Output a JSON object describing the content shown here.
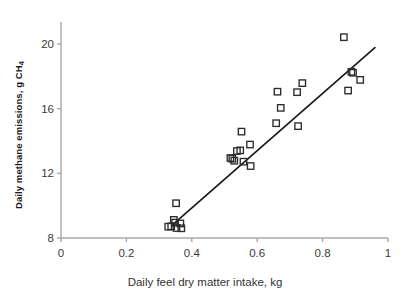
{
  "chart_data": {
    "type": "scatter",
    "title": "",
    "xlabel": "Daily feel dry matter intake, kg",
    "ylabel_prefix": "Daily methane emissions, g CH",
    "ylabel_subscript": "4",
    "xlim": [
      0,
      1
    ],
    "ylim": [
      8,
      21.2
    ],
    "xticks": [
      0,
      0.2,
      0.4,
      0.6,
      0.8,
      1
    ],
    "xtick_labels": [
      "0",
      "0.2",
      "0.4",
      "0.6",
      "0.8",
      "1"
    ],
    "yticks": [
      8,
      12,
      16,
      20
    ],
    "ytick_labels": [
      "8",
      "12",
      "16",
      "20"
    ],
    "grid": false,
    "legend": null,
    "marker": "open-square",
    "marker_color": "#2b2b2b",
    "axis_color": "#a8a8a8",
    "trendline_color": "#1a1a1a",
    "points": [
      {
        "x": 0.328,
        "y": 8.7
      },
      {
        "x": 0.337,
        "y": 8.72
      },
      {
        "x": 0.345,
        "y": 9.12
      },
      {
        "x": 0.349,
        "y": 8.95
      },
      {
        "x": 0.352,
        "y": 10.15
      },
      {
        "x": 0.353,
        "y": 8.62
      },
      {
        "x": 0.365,
        "y": 8.9
      },
      {
        "x": 0.368,
        "y": 8.6
      },
      {
        "x": 0.518,
        "y": 12.95
      },
      {
        "x": 0.524,
        "y": 12.9
      },
      {
        "x": 0.53,
        "y": 12.78
      },
      {
        "x": 0.538,
        "y": 13.38
      },
      {
        "x": 0.548,
        "y": 13.42
      },
      {
        "x": 0.552,
        "y": 14.58
      },
      {
        "x": 0.558,
        "y": 12.72
      },
      {
        "x": 0.578,
        "y": 13.78
      },
      {
        "x": 0.58,
        "y": 12.45
      },
      {
        "x": 0.658,
        "y": 15.1
      },
      {
        "x": 0.662,
        "y": 17.05
      },
      {
        "x": 0.672,
        "y": 16.05
      },
      {
        "x": 0.722,
        "y": 17.02
      },
      {
        "x": 0.725,
        "y": 14.92
      },
      {
        "x": 0.738,
        "y": 17.58
      },
      {
        "x": 0.865,
        "y": 20.42
      },
      {
        "x": 0.878,
        "y": 17.12
      },
      {
        "x": 0.888,
        "y": 18.28
      },
      {
        "x": 0.893,
        "y": 18.22
      },
      {
        "x": 0.915,
        "y": 17.78
      }
    ],
    "trendline": {
      "x_start": 0.34,
      "y_start": 8.8,
      "x_end": 0.96,
      "y_end": 19.78
    }
  }
}
